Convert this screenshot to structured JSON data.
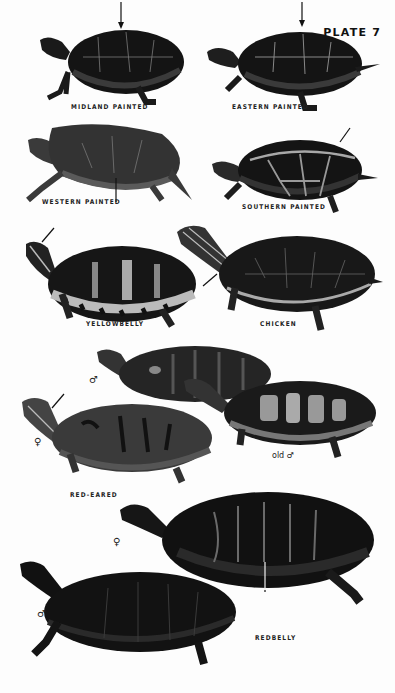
{
  "plate": {
    "title": "PLATE 7"
  },
  "species": [
    {
      "id": "midland-painted",
      "label": "MIDLAND PAINTED"
    },
    {
      "id": "eastern-painted",
      "label": "EASTERN PAINTED"
    },
    {
      "id": "western-painted",
      "label": "WESTERN PAINTED"
    },
    {
      "id": "southern-painted",
      "label": "SOUTHERN PAINTED"
    },
    {
      "id": "yellowbelly",
      "label": "YELLOWBELLY"
    },
    {
      "id": "chicken",
      "label": "CHICKEN"
    },
    {
      "id": "red-eared",
      "label": "RED-EARED",
      "variants": {
        "male": "♂",
        "female": "♀",
        "old_male": "old ♂"
      }
    },
    {
      "id": "redbelly",
      "label": "REDBELLY",
      "variants": {
        "female": "♀",
        "male": "♂"
      }
    }
  ],
  "colors": {
    "ink": "#111111",
    "shell_dark": "#141414",
    "shell_mid": "#3a3a3a",
    "seam": "#8a8a8a",
    "paper": "#fdfdfd"
  }
}
